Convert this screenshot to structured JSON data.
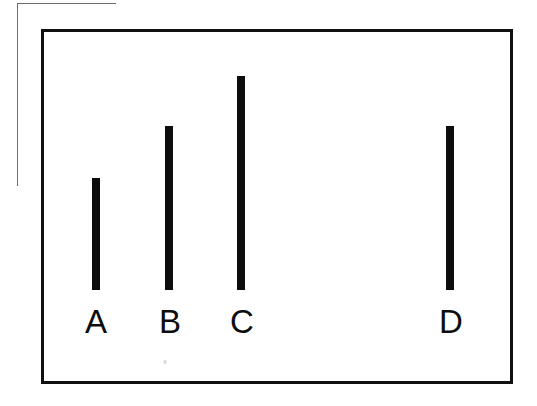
{
  "figure": {
    "background_color": "#ffffff",
    "frame": {
      "name": "plot-frame",
      "border_color": "#101010",
      "border_width_px": 3,
      "left": 41,
      "top": 29,
      "width": 472,
      "height": 355
    },
    "crop_mark": {
      "name": "crop-mark",
      "color": "#6e6e6e",
      "horizontal": {
        "left": 17,
        "top": 3,
        "length": 99
      },
      "vertical": {
        "left": 17,
        "top": 3,
        "length": 183
      }
    },
    "speck": {
      "left": 163,
      "top": 360,
      "color": "#dedede"
    }
  },
  "chart_data": {
    "type": "bar",
    "title": "",
    "subtitle": "",
    "xlabel": "",
    "ylabel": "",
    "grid": false,
    "legend": null,
    "axis_visible": false,
    "tick_labels": [],
    "categories": [
      "A",
      "B",
      "C",
      "D"
    ],
    "values": [
      112,
      164,
      214,
      164
    ],
    "value_unit": "px (bar height)",
    "baseline_y": 290,
    "ylim": [
      0,
      261
    ],
    "bar_color": "#0d0d0d",
    "bar_width_px": 8,
    "bars": [
      {
        "label": "A",
        "x": 92,
        "top": 178,
        "width": 8,
        "height": 112,
        "center_x": 96,
        "color": "#0d0d0d"
      },
      {
        "label": "B",
        "x": 165,
        "top": 126,
        "width": 8,
        "height": 164,
        "center_x": 169,
        "color": "#0d0d0d"
      },
      {
        "label": "C",
        "x": 237,
        "top": 76,
        "width": 8,
        "height": 214,
        "center_x": 241,
        "color": "#0d0d0d"
      },
      {
        "label": "D",
        "x": 446,
        "top": 126,
        "width": 8,
        "height": 164,
        "center_x": 450,
        "color": "#0d0d0d"
      }
    ],
    "labels": [
      {
        "text": "A",
        "center_x": 96,
        "top": 305
      },
      {
        "text": "B",
        "center_x": 170,
        "top": 305
      },
      {
        "text": "C",
        "center_x": 242,
        "top": 305
      },
      {
        "text": "D",
        "center_x": 451,
        "top": 305
      }
    ]
  }
}
